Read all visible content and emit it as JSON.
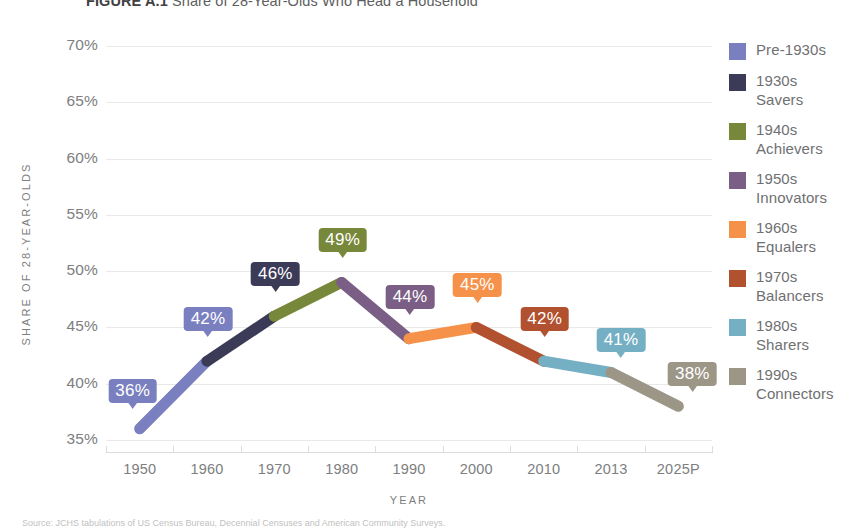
{
  "title": {
    "figure_number": "FIGURE A.1",
    "text": "Share of 28-Year-Olds Who Head a Household"
  },
  "source_note": "Source: JCHS tabulations of US Census Bureau, Decennial Censuses and American Community Surveys.",
  "legend": {
    "items": [
      {
        "label": "Pre-1930s",
        "color": "#7a7fc0"
      },
      {
        "label": "1930s\nSavers",
        "color": "#3b3a57"
      },
      {
        "label": "1940s\nAchievers",
        "color": "#78883b"
      },
      {
        "label": "1950s\nInnovators",
        "color": "#7b5e85"
      },
      {
        "label": "1960s\nEqualers",
        "color": "#f59149"
      },
      {
        "label": "1970s\nBalancers",
        "color": "#b1512f"
      },
      {
        "label": "1980s\nSharers",
        "color": "#74afc4"
      },
      {
        "label": "1990s\nConnectors",
        "color": "#9b9686"
      }
    ]
  },
  "chart_data": {
    "type": "line",
    "title": "Share of 28-Year-Olds Who Head a Household",
    "xlabel": "YEAR",
    "ylabel": "SHARE OF 28-YEAR-OLDS",
    "categories": [
      "1950",
      "1960",
      "1970",
      "1980",
      "1990",
      "2000",
      "2010",
      "2013",
      "2025P"
    ],
    "values": [
      36,
      42,
      46,
      49,
      44,
      45,
      42,
      41,
      38
    ],
    "value_labels": [
      "36%",
      "42%",
      "46%",
      "49%",
      "44%",
      "45%",
      "42%",
      "41%",
      "38%"
    ],
    "point_colors": [
      "#7a7fc0",
      "#7a7fc0",
      "#3b3a57",
      "#78883b",
      "#7b5e85",
      "#f59149",
      "#b1512f",
      "#74afc4",
      "#9b9686"
    ],
    "segment_colors": [
      "#7a7fc0",
      "#3b3a57",
      "#78883b",
      "#7b5e85",
      "#f59149",
      "#b1512f",
      "#74afc4",
      "#9b9686"
    ],
    "ylim": [
      35,
      70
    ],
    "yticks": [
      70,
      65,
      60,
      55,
      50,
      45,
      40,
      35
    ],
    "ytick_labels": [
      "70%",
      "65%",
      "60%",
      "55%",
      "50%",
      "45%",
      "40%",
      "35%"
    ],
    "grid": true,
    "legend_position": "right",
    "series": [
      {
        "name": "Share of 28-year-olds who head a household",
        "points": [
          {
            "x": "1950",
            "y": 36,
            "cohort": "Pre-1930s"
          },
          {
            "x": "1960",
            "y": 42,
            "cohort": "Pre-1930s"
          },
          {
            "x": "1970",
            "y": 46,
            "cohort": "1930s Savers"
          },
          {
            "x": "1980",
            "y": 49,
            "cohort": "1940s Achievers"
          },
          {
            "x": "1990",
            "y": 44,
            "cohort": "1950s Innovators"
          },
          {
            "x": "2000",
            "y": 45,
            "cohort": "1960s Equalers"
          },
          {
            "x": "2010",
            "y": 42,
            "cohort": "1970s Balancers"
          },
          {
            "x": "2013",
            "y": 41,
            "cohort": "1980s Sharers"
          },
          {
            "x": "2025P",
            "y": 38,
            "cohort": "1990s Connectors"
          }
        ]
      }
    ]
  }
}
